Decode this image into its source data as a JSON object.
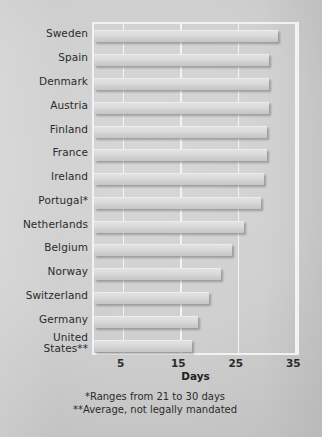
{
  "chart_data": {
    "type": "bar",
    "orientation": "horizontal",
    "title": "",
    "xlabel": "Days",
    "ylabel": "",
    "xlim": [
      0,
      36
    ],
    "xticks": [
      5,
      15,
      25,
      35
    ],
    "grid": true,
    "gridlines_at": [
      5,
      15,
      25,
      35
    ],
    "legend": null,
    "categories": [
      "Sweden",
      "Spain",
      "Denmark",
      "Austria",
      "Finland",
      "France",
      "Ireland",
      "Portugal*",
      "Netherlands",
      "Belgium",
      "Norway",
      "Switzerland",
      "Germany",
      "United\nStates**"
    ],
    "values": [
      32,
      30.5,
      30.5,
      30.5,
      30,
      30,
      29.5,
      29,
      26,
      24,
      22,
      20,
      18,
      17
    ],
    "annotations": [
      "*Ranges from 21 to 30 days",
      "**Average, not legally mandated"
    ]
  },
  "axis": {
    "x_title": "Days",
    "tick_labels": [
      "5",
      "15",
      "25",
      "35"
    ]
  },
  "footnotes": {
    "one": "*Ranges from 21 to 30 days",
    "two": "**Average, not legally mandated"
  },
  "colors": {
    "background": "#cfcfcf",
    "bar": "#dcdcdc",
    "frame": "#f2f2f2",
    "gridline": "#f4f4f4",
    "text": "#2b2b2b"
  }
}
